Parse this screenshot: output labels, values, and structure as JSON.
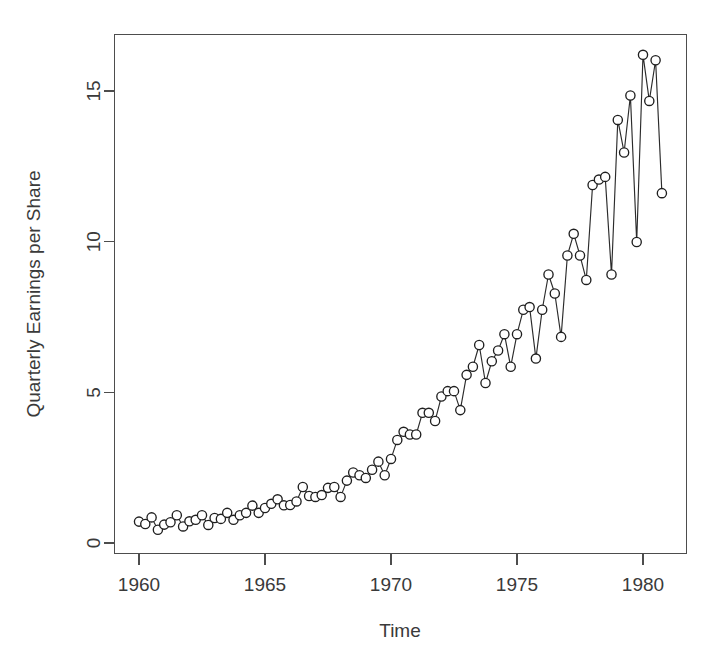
{
  "chart_data": {
    "type": "line",
    "title": "",
    "subtitle": "",
    "xlabel": "Time",
    "ylabel": "Quarterly Earnings per Share",
    "xlim": [
      1959.75,
      1981.1
    ],
    "ylim": [
      -0.25,
      17.0
    ],
    "grid": false,
    "legend": false,
    "legend_position": "none",
    "marker": "open-circle",
    "line_style": "solid",
    "xticks": [
      1960,
      1965,
      1970,
      1975,
      1980
    ],
    "xtick_labels": [
      "1960",
      "1965",
      "1970",
      "1975",
      "1980"
    ],
    "yticks": [
      0,
      5,
      10,
      15
    ],
    "ytick_labels": [
      "0",
      "5",
      "10",
      "15"
    ],
    "series": [
      {
        "name": "Quarterly Earnings per Share",
        "x": [
          1960.0,
          1960.25,
          1960.5,
          1960.75,
          1961.0,
          1961.25,
          1961.5,
          1961.75,
          1962.0,
          1962.25,
          1962.5,
          1962.75,
          1963.0,
          1963.25,
          1963.5,
          1963.75,
          1964.0,
          1964.25,
          1964.5,
          1964.75,
          1965.0,
          1965.25,
          1965.5,
          1965.75,
          1966.0,
          1966.25,
          1966.5,
          1966.75,
          1967.0,
          1967.25,
          1967.5,
          1967.75,
          1968.0,
          1968.25,
          1968.5,
          1968.75,
          1969.0,
          1969.25,
          1969.5,
          1969.75,
          1970.0,
          1970.25,
          1970.5,
          1970.75,
          1971.0,
          1971.25,
          1971.5,
          1971.75,
          1972.0,
          1972.25,
          1972.5,
          1972.75,
          1973.0,
          1973.25,
          1973.5,
          1973.75,
          1974.0,
          1974.25,
          1974.5,
          1974.75,
          1975.0,
          1975.25,
          1975.5,
          1975.75,
          1976.0,
          1976.25,
          1976.5,
          1976.75,
          1977.0,
          1977.25,
          1977.5,
          1977.75,
          1978.0,
          1978.25,
          1978.5,
          1978.75,
          1979.0,
          1979.25,
          1979.5,
          1979.75,
          1980.0,
          1980.25,
          1980.5,
          1980.75
        ],
        "values": [
          0.71,
          0.63,
          0.85,
          0.44,
          0.61,
          0.69,
          0.92,
          0.55,
          0.72,
          0.77,
          0.92,
          0.6,
          0.83,
          0.8,
          1.0,
          0.77,
          0.92,
          1.0,
          1.24,
          1.0,
          1.16,
          1.3,
          1.45,
          1.25,
          1.26,
          1.38,
          1.86,
          1.56,
          1.53,
          1.59,
          1.83,
          1.86,
          1.53,
          2.07,
          2.34,
          2.25,
          2.16,
          2.43,
          2.7,
          2.25,
          2.79,
          3.42,
          3.69,
          3.6,
          3.6,
          4.32,
          4.32,
          4.05,
          4.86,
          5.04,
          5.04,
          4.41,
          5.58,
          5.85,
          6.57,
          5.31,
          6.03,
          6.39,
          6.93,
          5.85,
          6.93,
          7.74,
          7.83,
          6.12,
          7.74,
          8.91,
          8.28,
          6.84,
          9.54,
          10.26,
          9.54,
          8.73,
          11.88,
          12.06,
          12.15,
          8.91,
          14.04,
          12.96,
          14.85,
          9.99,
          16.2,
          14.67,
          16.02,
          11.61
        ]
      }
    ]
  },
  "axes": {
    "x_title": "Time",
    "y_title": "Quarterly Earnings per Share"
  }
}
